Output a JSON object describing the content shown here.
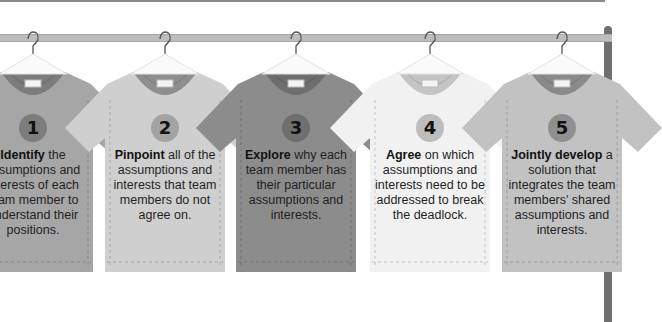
{
  "steps": [
    {
      "number": "1",
      "keyword": "Identify",
      "rest": " the assumptions and interests of each team member to understand their positions.",
      "lines": [
        "Identify the",
        "assumptions and",
        "interests of each",
        "team member to",
        "understand their",
        "positions."
      ],
      "color": "#a6a6a6",
      "collar": "#7c7c7c",
      "badge": "#7d7d7d"
    },
    {
      "number": "2",
      "keyword": "Pinpoint",
      "rest": " all of the assumptions and interests that team members do not agree on.",
      "lines": [
        "Pinpoint all",
        "of the assumptions",
        "and interests that",
        "team members do",
        "not agree on."
      ],
      "color": "#cfcfcf",
      "collar": "#8e8e8e",
      "badge": "#a3a3a3"
    },
    {
      "number": "3",
      "keyword": "Explore",
      "rest": " why each team member has their particular assumptions and interests.",
      "lines": [
        "Explore why",
        "each team member",
        "has their particular",
        "assumptions and",
        "interests."
      ],
      "color": "#8c8c8c",
      "collar": "#6e6e6e",
      "badge": "#6f6f6f"
    },
    {
      "number": "4",
      "keyword": "Agree",
      "rest": " on which assumptions and interests need to be addressed to break the deadlock.",
      "lines": [
        "Agree on which",
        "assumptions and",
        "interests need to be",
        "addressed to break",
        "the deadlock."
      ],
      "color": "#f1f1f1",
      "collar": "#c4c4c4",
      "badge": "#bdbdbd"
    },
    {
      "number": "5",
      "keyword": "Jointly develop",
      "rest": " a solution that integrates the team members' shared assumptions and interests.",
      "lines": [
        "Jointly develop",
        "a solution that",
        "integrates the",
        "team members'",
        "shared assumptions",
        "and interests."
      ],
      "color": "#c2c2c2",
      "collar": "#8a8a8a",
      "badge": "#8f8f8f"
    }
  ]
}
